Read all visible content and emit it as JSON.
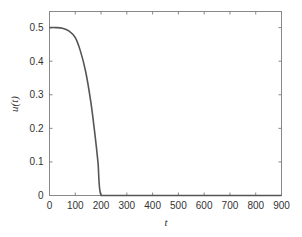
{
  "chart_data": {
    "type": "line",
    "title": "",
    "xlabel": "t",
    "ylabel": "u(t)",
    "xlim": [
      0,
      900
    ],
    "ylim": [
      0,
      0.548
    ],
    "xticks": [
      0,
      100,
      200,
      300,
      400,
      500,
      600,
      700,
      800,
      900
    ],
    "xtick_labels": [
      "0",
      "100",
      "200",
      "300",
      "400",
      "500",
      "600",
      "700",
      "800",
      "900"
    ],
    "yticks": [
      0,
      0.1,
      0.2,
      0.3,
      0.4,
      0.5
    ],
    "ytick_labels": [
      "0",
      "0.1",
      "0.2",
      "0.3",
      "0.4",
      "0.5"
    ],
    "grid": false,
    "legend": null,
    "series": [
      {
        "name": "u(t)",
        "color": "#555555",
        "x": [
          0,
          25,
          50,
          75,
          100,
          120,
          140,
          160,
          175,
          188,
          200,
          250,
          300,
          400,
          500,
          600,
          700,
          800,
          900
        ],
        "y": [
          0.5,
          0.5,
          0.498,
          0.49,
          0.47,
          0.43,
          0.37,
          0.28,
          0.19,
          0.1,
          0,
          0,
          0,
          0,
          0,
          0,
          0,
          0,
          0
        ]
      }
    ]
  },
  "colors": {
    "axis": "#888888",
    "line": "#555555",
    "text": "#333333"
  }
}
